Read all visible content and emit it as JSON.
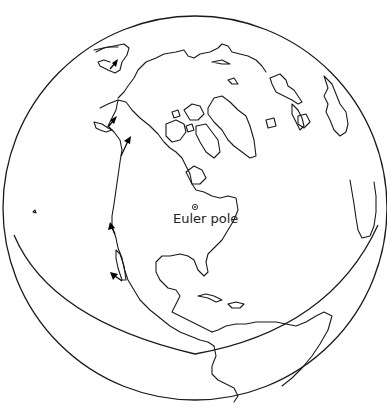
{
  "figure": {
    "type": "orthographic-globe",
    "background_color": "#ffffff",
    "line_color": "#1a1a1a",
    "globe": {
      "outer_circle": {
        "cx": 195,
        "cy": 208,
        "r": 192
      },
      "cut_arc_bottom_y": 354
    },
    "euler_pole": {
      "label": "Euler pole",
      "marker": "circled-dot",
      "x": 195,
      "y": 207
    },
    "arrows": [
      {
        "name": "arrow-alaska-north",
        "x1": 110,
        "y1": 69,
        "x2": 117,
        "y2": 61
      },
      {
        "name": "arrow-alaska-gulf",
        "x1": 108,
        "y1": 126,
        "x2": 116,
        "y2": 118
      },
      {
        "name": "arrow-british-columbia",
        "x1": 122,
        "y1": 153,
        "x2": 131,
        "y2": 138
      },
      {
        "name": "arrow-california-north",
        "x1": 116,
        "y1": 235,
        "x2": 110,
        "y2": 224
      },
      {
        "name": "arrow-baja",
        "x1": 122,
        "y1": 280,
        "x2": 111,
        "y2": 272
      }
    ],
    "regions_drawn": [
      "Alaska",
      "Siberia",
      "Arctic Ocean coast",
      "Canadian Arctic Archipelago",
      "Greenland",
      "Iceland",
      "Scandinavia",
      "Western Europe",
      "North Africa",
      "North America",
      "Gulf of Mexico",
      "Caribbean (Cuba, Hispaniola)",
      "Central America",
      "South America (northern)"
    ]
  }
}
